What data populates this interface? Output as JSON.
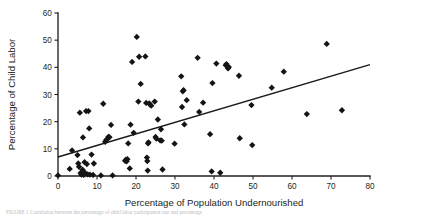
{
  "figure": {
    "caption_fragment": "FIGURE 1  Correlation between the percentage of child labor participation rate and percentage"
  },
  "chart_data": {
    "type": "scatter",
    "title": "",
    "xlabel": "Percentage of Population Undernourished",
    "ylabel": "Percentage of Child Labor",
    "xlim": [
      0,
      80
    ],
    "ylim": [
      0,
      60
    ],
    "xticks": [
      0,
      10,
      20,
      30,
      40,
      50,
      60,
      70,
      80
    ],
    "yticks": [
      0,
      10,
      20,
      30,
      40,
      50,
      60
    ],
    "grid": false,
    "legend": null,
    "marker": "diamond",
    "marker_color": "#141414",
    "trendline": {
      "type": "linear",
      "color": "#1a1a1a",
      "x_start": 0,
      "y_start": 7.0,
      "x_end": 80,
      "y_end": 41.0
    },
    "points": [
      [
        0.0,
        0.2
      ],
      [
        3.0,
        2.6
      ],
      [
        3.6,
        9.4
      ],
      [
        5.0,
        7.7
      ],
      [
        5.2,
        4.6
      ],
      [
        5.4,
        3.4
      ],
      [
        5.6,
        23.3
      ],
      [
        5.8,
        1.1
      ],
      [
        6.0,
        0.5
      ],
      [
        6.1,
        0.9
      ],
      [
        6.3,
        2.3
      ],
      [
        6.4,
        14.2
      ],
      [
        6.6,
        0.4
      ],
      [
        6.8,
        5.1
      ],
      [
        6.9,
        1.2
      ],
      [
        7.2,
        23.9
      ],
      [
        7.4,
        4.4
      ],
      [
        7.6,
        0.6
      ],
      [
        7.8,
        23.9
      ],
      [
        8.0,
        17.5
      ],
      [
        8.2,
        0.5
      ],
      [
        8.6,
        7.9
      ],
      [
        9.0,
        0.4
      ],
      [
        9.2,
        4.6
      ],
      [
        11.0,
        0.2
      ],
      [
        11.6,
        26.6
      ],
      [
        12.1,
        12.6
      ],
      [
        12.4,
        13.3
      ],
      [
        12.6,
        13.5
      ],
      [
        12.9,
        14.4
      ],
      [
        13.2,
        14.3
      ],
      [
        13.6,
        18.8
      ],
      [
        14.0,
        0.2
      ],
      [
        17.2,
        5.6
      ],
      [
        17.4,
        6.0
      ],
      [
        17.6,
        5.4
      ],
      [
        17.8,
        6.2
      ],
      [
        18.0,
        12.0
      ],
      [
        18.4,
        2.8
      ],
      [
        18.6,
        18.9
      ],
      [
        19.0,
        42.0
      ],
      [
        19.4,
        15.9
      ],
      [
        20.2,
        51.2
      ],
      [
        20.6,
        27.4
      ],
      [
        20.8,
        43.9
      ],
      [
        21.2,
        33.9
      ],
      [
        22.4,
        44.0
      ],
      [
        22.6,
        26.9
      ],
      [
        22.8,
        6.8
      ],
      [
        22.9,
        5.5
      ],
      [
        23.0,
        2.0
      ],
      [
        23.1,
        12.0
      ],
      [
        23.2,
        12.4
      ],
      [
        23.4,
        26.7
      ],
      [
        23.6,
        26.3
      ],
      [
        23.9,
        25.9
      ],
      [
        24.8,
        27.4
      ],
      [
        25.0,
        14.4
      ],
      [
        25.2,
        13.8
      ],
      [
        25.6,
        20.8
      ],
      [
        26.2,
        13.1
      ],
      [
        26.4,
        17.2
      ],
      [
        26.6,
        13.0
      ],
      [
        26.8,
        2.4
      ],
      [
        29.9,
        11.9
      ],
      [
        31.6,
        36.7
      ],
      [
        31.8,
        25.4
      ],
      [
        32.0,
        31.2
      ],
      [
        32.2,
        31.6
      ],
      [
        32.4,
        19.0
      ],
      [
        33.0,
        27.9
      ],
      [
        35.8,
        43.5
      ],
      [
        36.2,
        23.6
      ],
      [
        37.2,
        27.0
      ],
      [
        39.0,
        15.4
      ],
      [
        39.4,
        1.7
      ],
      [
        39.6,
        34.2
      ],
      [
        40.6,
        41.4
      ],
      [
        41.6,
        1.2
      ],
      [
        43.0,
        40.8
      ],
      [
        43.2,
        41.2
      ],
      [
        43.6,
        39.6
      ],
      [
        43.8,
        40.1
      ],
      [
        46.4,
        36.9
      ],
      [
        46.6,
        13.9
      ],
      [
        49.6,
        26.1
      ],
      [
        49.8,
        11.4
      ],
      [
        54.8,
        32.5
      ],
      [
        57.9,
        38.4
      ],
      [
        63.8,
        22.8
      ],
      [
        68.9,
        48.6
      ],
      [
        72.8,
        24.2
      ]
    ]
  }
}
